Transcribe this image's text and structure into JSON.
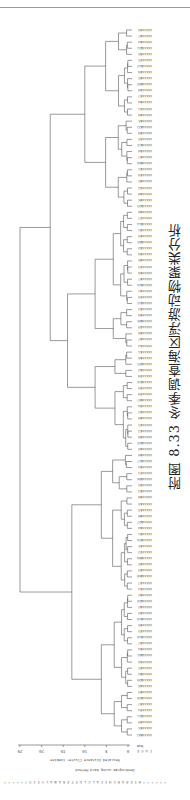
{
  "figure": {
    "caption": "附图 8.33  冬季调查海区浮游动物聚类分析",
    "header_text": "* * * * * * H I E R A R C H I C A L   C L U S T E R   A N A L Y S I S * * * * * *",
    "method": "Dendrogram using Ward Method",
    "axis_title": "Rescaled Distance Cluster Combine",
    "case_label": "C A S E",
    "case_cols": [
      "Label",
      "Num"
    ],
    "orientation": "rotated 180°"
  },
  "chart_data": {
    "type": "dendrogram",
    "title": "冬季调查海区浮游动物聚类分析",
    "xlabel": "Rescaled Distance Cluster Combine",
    "ylabel": "CASE Label Num",
    "xticks": [
      0,
      5,
      10,
      15,
      20,
      25
    ],
    "xlim": [
      0,
      25
    ],
    "n_leaves": 117,
    "major_clusters": [
      {
        "name": "cluster-A",
        "leaf_range": [
          1,
          30
        ],
        "merge_distance": 10
      },
      {
        "name": "cluster-B",
        "leaf_range": [
          31,
          70
        ],
        "merge_distance": 14
      },
      {
        "name": "cluster-C",
        "leaf_range": [
          71,
          117
        ],
        "merge_distance": 13
      }
    ],
    "root_merge_distance": 25
  }
}
